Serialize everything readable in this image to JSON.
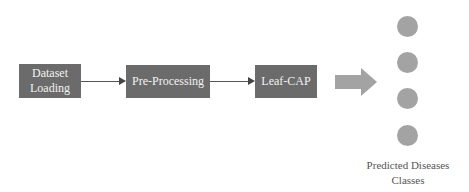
{
  "diagram": {
    "nodes": [
      {
        "id": "dataset-loading",
        "label": "Dataset\nLoading",
        "line1": "Dataset",
        "line2": "Loading"
      },
      {
        "id": "pre-processing",
        "label": "Pre-Processing"
      },
      {
        "id": "leaf-cap",
        "label": "Leaf-CAP"
      }
    ],
    "edges": [
      {
        "from": "dataset-loading",
        "to": "pre-processing"
      },
      {
        "from": "pre-processing",
        "to": "leaf-cap"
      },
      {
        "from": "leaf-cap",
        "to": "output-classes",
        "style": "block-arrow"
      }
    ],
    "output": {
      "class_count": 4,
      "label_line1": "Predicted Diseases",
      "label_line2": "Classes"
    },
    "colors": {
      "box_fill": "#6b6b6b",
      "box_text": "#f2f2f2",
      "arrow_fill": "#a3a3a3",
      "circle_fill": "#a3a3a3"
    }
  }
}
